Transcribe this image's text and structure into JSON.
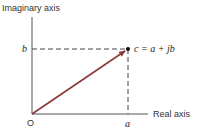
{
  "diagram": {
    "y_axis_label": "Imaginary axis",
    "x_axis_label": "Real axis",
    "origin_label": "O",
    "a_label": "a",
    "b_label": "b",
    "point_label": "c = a + jb",
    "colors": {
      "axis": "#555555",
      "arrow": "#8b3a3a",
      "dash": "#444444",
      "point": "#000000"
    }
  }
}
